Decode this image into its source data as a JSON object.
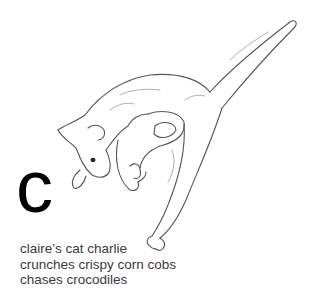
{
  "illustration": {
    "subject": "cat-sketch",
    "description": "pencil line drawing of a cat leaping downward with tail raised"
  },
  "letter": "c",
  "caption": {
    "lines": [
      "claire’s cat charlie",
      "crunches crispy corn cobs",
      "chases crocodiles"
    ]
  },
  "colors": {
    "background": "#ffffff",
    "letter": "#000000",
    "caption": "#3a3a3a",
    "sketch": "#555555"
  }
}
